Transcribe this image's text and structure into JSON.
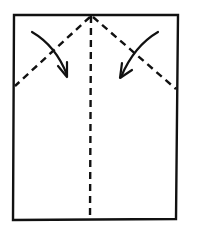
{
  "diagram": {
    "type": "origami-fold-step",
    "colors": {
      "stroke": "#111111",
      "background": "#ffffff"
    },
    "paper": {
      "x1": 14,
      "y1": 15,
      "x2": 178,
      "y2": 220
    },
    "fold_lines": [
      {
        "name": "center-crease",
        "from": [
          91,
          15
        ],
        "to": [
          90,
          220
        ],
        "style": "dashed"
      },
      {
        "name": "left-diagonal-fold",
        "from": [
          91,
          15
        ],
        "to": [
          14,
          87
        ],
        "style": "dashed"
      },
      {
        "name": "right-diagonal-fold",
        "from": [
          91,
          15
        ],
        "to": [
          176,
          90
        ],
        "style": "dashed"
      }
    ],
    "arrows": [
      {
        "name": "left-corner-fold-arrow",
        "direction": "down-right"
      },
      {
        "name": "right-corner-fold-arrow",
        "direction": "down-left"
      }
    ]
  }
}
